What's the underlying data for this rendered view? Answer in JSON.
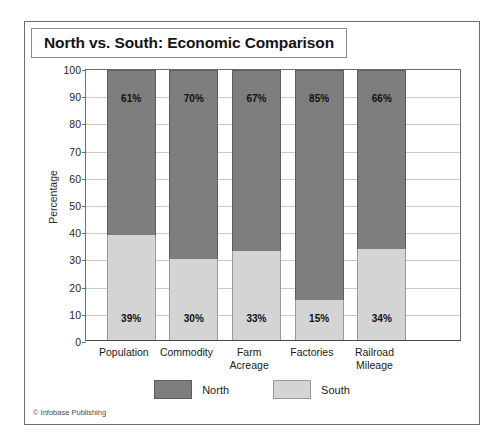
{
  "figure": {
    "title": "North vs. South: Economic Comparison",
    "credit": "© Infobase Publishing"
  },
  "legend": {
    "position": "bottom-center",
    "items": [
      {
        "label": "North",
        "color": "#7e7e7e"
      },
      {
        "label": "South",
        "color": "#d4d4d4"
      }
    ]
  },
  "chart_data": {
    "type": "bar",
    "subtype": "stacked-column-100",
    "title": "North vs. South: Economic Comparison",
    "xlabel": "",
    "ylabel": "Percentage",
    "ylim": [
      0,
      100
    ],
    "ytick_step": 10,
    "yticks": [
      0,
      10,
      20,
      30,
      40,
      50,
      60,
      70,
      80,
      90,
      100
    ],
    "ytick_labels": [
      "0",
      "10",
      "20",
      "30",
      "40",
      "50",
      "60",
      "70",
      "80",
      "90",
      "100"
    ],
    "grid": true,
    "grid_axis": "y",
    "categories": [
      "Population",
      "Commodity",
      "Farm Acreage",
      "Factories",
      "Railroad Mileage"
    ],
    "category_label_lines": [
      [
        "Population"
      ],
      [
        "Commodity"
      ],
      [
        "Farm Acreage"
      ],
      [
        "Factories"
      ],
      [
        "Railroad",
        "Mileage"
      ]
    ],
    "series": [
      {
        "name": "North",
        "color": "#7e7e7e",
        "values": [
          61,
          70,
          67,
          85,
          66
        ],
        "data_labels": [
          "61%",
          "70%",
          "67%",
          "85%",
          "66%"
        ]
      },
      {
        "name": "South",
        "color": "#d4d4d4",
        "values": [
          39,
          30,
          33,
          15,
          34
        ],
        "data_labels": [
          "39%",
          "30%",
          "33%",
          "15%",
          "34%"
        ]
      }
    ]
  }
}
